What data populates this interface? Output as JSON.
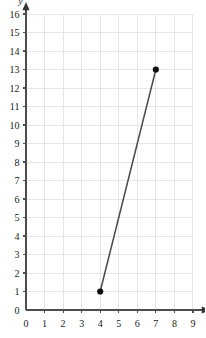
{
  "chart_data": {
    "type": "line",
    "title": "",
    "xlabel": "x",
    "ylabel": "y",
    "xlim": [
      0,
      9
    ],
    "ylim": [
      0,
      16
    ],
    "xticks": [
      0,
      1,
      2,
      3,
      4,
      5,
      6,
      7,
      8,
      9
    ],
    "yticks": [
      0,
      1,
      2,
      3,
      4,
      5,
      6,
      7,
      8,
      9,
      10,
      11,
      12,
      13,
      14,
      15,
      16
    ],
    "xtick_labels": [
      "0",
      "1",
      "2",
      "3",
      "4",
      "5",
      "6",
      "7",
      "8",
      "9"
    ],
    "ytick_labels": [
      "0",
      "1",
      "2",
      "3",
      "4",
      "5",
      "6",
      "7",
      "8",
      "9",
      "10",
      "11",
      "12",
      "13",
      "14",
      "15",
      "16"
    ],
    "grid": true,
    "legend": null,
    "series": [
      {
        "name": "segment",
        "x": [
          4,
          7
        ],
        "y": [
          1,
          13
        ],
        "marker": "filled-circle",
        "line_color": "#4a4a4a",
        "marker_color": "#111111"
      }
    ],
    "points": [
      {
        "x": 4,
        "y": 1,
        "label": "(4, 1)"
      },
      {
        "x": 7,
        "y": 13,
        "label": "(7, 13)"
      }
    ],
    "annotations": []
  },
  "style": {
    "background": "#ffffff",
    "grid_color": "#e6e6e6",
    "axis_color": "#4d4d4d",
    "text_color": "#1a1a1a"
  }
}
